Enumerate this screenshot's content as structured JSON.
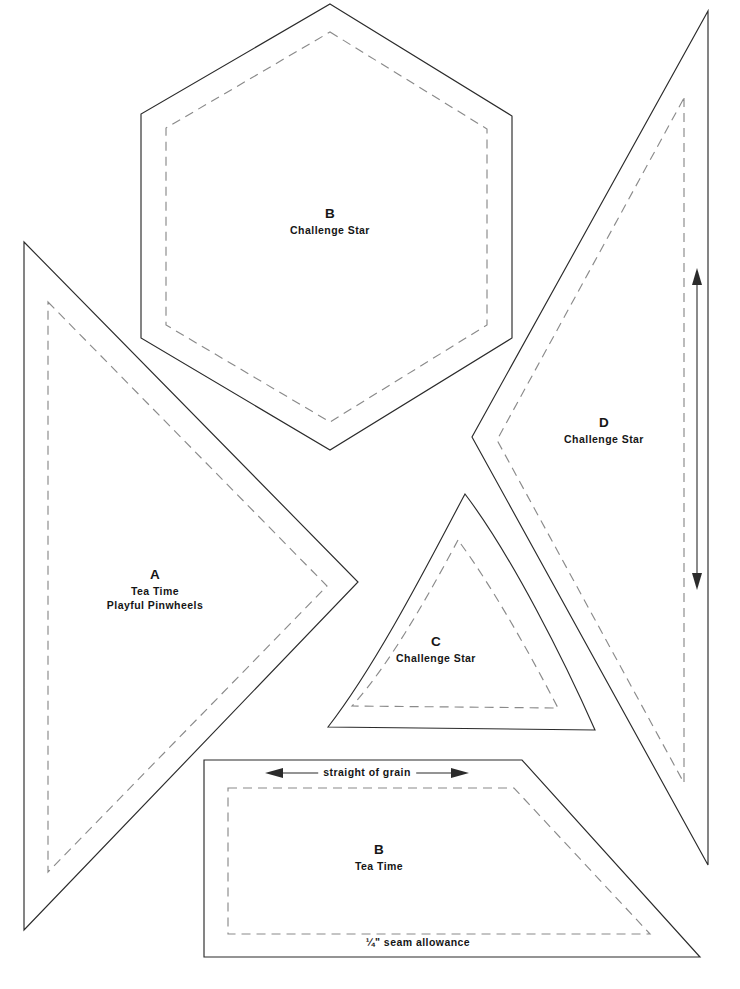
{
  "sheet": {
    "title": "Quilt Template Pattern Sheet",
    "background_color": "#ffffff",
    "cut_line_color": "#2b2b2b",
    "seam_line_color": "#8a8a8a"
  },
  "pieces": [
    {
      "id": "piece-b-hexagon",
      "letter": "B",
      "pattern": "Challenge Star",
      "shape": "hexagon"
    },
    {
      "id": "piece-a-chevron",
      "letter": "A",
      "pattern_line1": "Tea Time",
      "pattern_line2": "Playful Pinwheels",
      "shape": "chevron"
    },
    {
      "id": "piece-c-curved-triangle",
      "letter": "C",
      "pattern": "Challenge Star",
      "shape": "curved-triangle"
    },
    {
      "id": "piece-d-chevron",
      "letter": "D",
      "pattern": "Challenge Star",
      "shape": "chevron"
    },
    {
      "id": "piece-b-trapezoid",
      "letter": "B",
      "pattern": "Tea Time",
      "shape": "trapezoid"
    }
  ],
  "annotations": {
    "straight_of_grain": "straight of grain",
    "seam_allowance": "¼\" seam allowance"
  }
}
